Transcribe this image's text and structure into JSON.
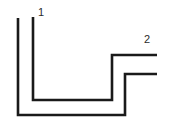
{
  "figure": {
    "background_color": "#ffffff",
    "line_color": "#1a1a1a",
    "label_color": "#2b2b2b",
    "line_width": 2.6,
    "width": 189,
    "height": 135
  },
  "callouts": [
    {
      "id": "callout-1",
      "label": "1",
      "label_x": 41,
      "label_y": 16,
      "target_x": 33,
      "target_y": 17
    },
    {
      "id": "callout-2",
      "label": "2",
      "label_x": 147,
      "label_y": 43,
      "target_x": 152,
      "target_y": 55
    }
  ],
  "paths": [
    {
      "id": "outer-profile",
      "name": "outer-stepped-profile",
      "points": "18,18 18,115 125,115 125,74 157,74"
    },
    {
      "id": "inner-profile",
      "name": "inner-stepped-profile",
      "points": "33,17 33,100 112,100 112,55 157,55"
    }
  ]
}
